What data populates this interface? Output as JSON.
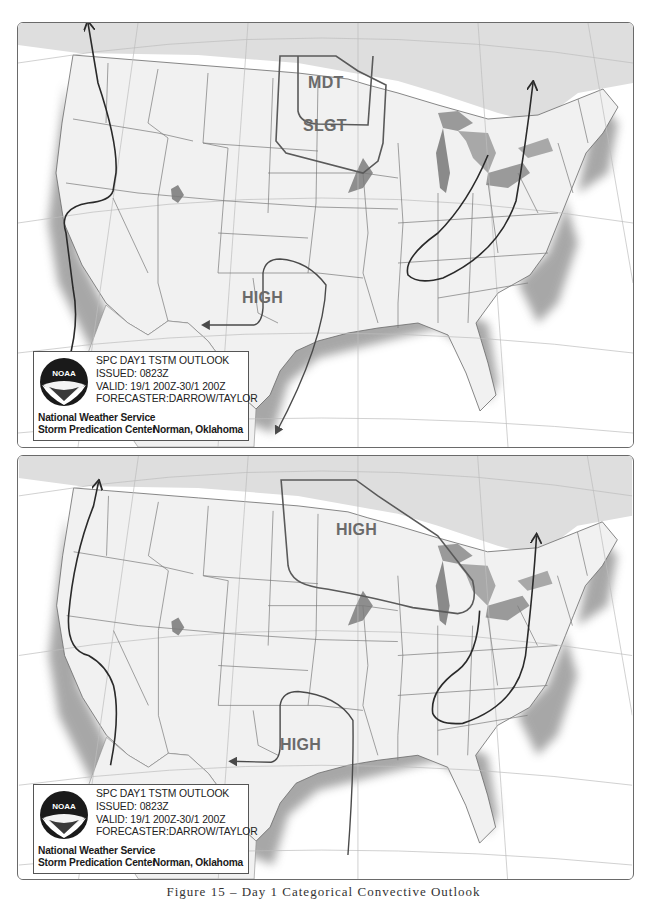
{
  "figure": {
    "caption": "Figure 15 – Day 1 Categorical Convective Outlook"
  },
  "colors": {
    "land": "#f1f1f1",
    "canada": "#dedede",
    "water": "#ffffff",
    "state_border": "#7a7a7a",
    "graticule": "#bdbdbd",
    "lakes": "#9a9a9a",
    "jet_arrow": "#2a2a2a",
    "outlook_line": "#5a5a5a",
    "label_gray": "#6a6a6a"
  },
  "panels": [
    {
      "id": "top",
      "legend": {
        "title": "SPC DAY1 TSTM OUTLOOK",
        "issued": "ISSUED: 0823Z",
        "valid": "VALID: 19/1 200Z-30/1 200Z",
        "forecaster": "FORECASTER:DARROW/TAYLOR",
        "org_line1": "National Weather Service",
        "org_line2": "Storm Predication Center",
        "location": "Norman, Oklahoma",
        "logo_text": "NOAA"
      },
      "labels": {
        "mdt": "MDT",
        "slgt": "SLGT",
        "high": "HIGH"
      },
      "risk_areas": [
        {
          "category": "MDT",
          "region": "North Dakota / South Dakota"
        },
        {
          "category": "SLGT",
          "region": "Dakotas / Minnesota / Nebraska"
        },
        {
          "category": "HIGH",
          "region": "Texas / Southern Plains (pressure)"
        }
      ],
      "arrows": [
        {
          "name": "west-coast-jet",
          "direction": "north"
        },
        {
          "name": "eastern-jet",
          "direction": "northeast"
        },
        {
          "name": "texas-trough",
          "direction": "southwest"
        }
      ]
    },
    {
      "id": "bottom",
      "legend": {
        "title": "SPC DAY1 TSTM OUTLOOK",
        "issued": "ISSUED: 0823Z",
        "valid": "VALID: 19/1 200Z-30/1 200Z",
        "forecaster": "FORECASTER:DARROW/TAYLOR",
        "org_line1": "National Weather Service",
        "org_line2": "Storm Predication Center",
        "location": "Norman, Oklahoma",
        "logo_text": "NOAA"
      },
      "labels": {
        "high_north": "HIGH",
        "high_south": "HIGH"
      },
      "risk_areas": [
        {
          "category": "HIGH",
          "region": "Northern Plains / Upper Midwest (pressure)"
        },
        {
          "category": "HIGH",
          "region": "Texas / Southern Plains (pressure)"
        }
      ],
      "arrows": [
        {
          "name": "west-coast-jet",
          "direction": "north"
        },
        {
          "name": "eastern-jet",
          "direction": "northeast"
        },
        {
          "name": "texas-trough",
          "direction": "west"
        }
      ]
    }
  ]
}
